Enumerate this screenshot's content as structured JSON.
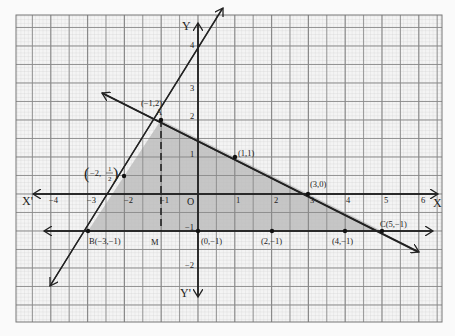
{
  "chart_data": {
    "type": "line",
    "title": "",
    "xlabel": "X",
    "ylabel": "Y",
    "x_negative_label": "X'",
    "y_negative_label": "Y'",
    "origin_label": "O",
    "xlim": [
      -4.5,
      6.5
    ],
    "ylim": [
      -3.5,
      5
    ],
    "grid": true,
    "x_ticks": [
      "-4",
      "-3",
      "-2",
      "-1",
      "1",
      "2",
      "3",
      "4",
      "5",
      "6"
    ],
    "y_ticks": [
      "4",
      "3",
      "2",
      "1",
      "-1",
      "-2"
    ],
    "series": [
      {
        "name": "line BA (3x - 2y + 7 = 0)",
        "points": [
          [
            -4.1,
            -2.5
          ],
          [
            0.6,
            4.7
          ]
        ]
      },
      {
        "name": "line x + 2y = 3",
        "points": [
          [
            -2.6,
            2.8
          ],
          [
            6,
            -1.5
          ]
        ]
      },
      {
        "name": "line y = -1",
        "points": [
          [
            -3.9,
            -1
          ],
          [
            6.3,
            -1
          ]
        ]
      },
      {
        "name": "dashed AM (x = -1)",
        "points": [
          [
            -1,
            2
          ],
          [
            -1,
            -1
          ]
        ]
      }
    ],
    "shaded_region": {
      "vertices": [
        [
          -3,
          -1
        ],
        [
          -1,
          2
        ],
        [
          5,
          -1
        ]
      ],
      "fill": "#bdbdbd"
    },
    "points": [
      {
        "label": "(-1,2)",
        "sublabel": "A",
        "x": -1,
        "y": 2
      },
      {
        "label": "B(-3,-1)",
        "x": -3,
        "y": -1
      },
      {
        "label": "C(5,-1)",
        "x": 5,
        "y": -1
      },
      {
        "label": "(1,1)",
        "x": 1,
        "y": 1
      },
      {
        "label": "(3,0)",
        "x": 3,
        "y": 0
      },
      {
        "label": "(0,-1)",
        "x": 0,
        "y": -1
      },
      {
        "label": "(2,-1)",
        "x": 2,
        "y": -1
      },
      {
        "label": "(4,-1)",
        "x": 4,
        "y": -1
      },
      {
        "label": "(-2, 1/2)",
        "x": -2,
        "y": 0.5
      },
      {
        "label": "M",
        "x": -1,
        "y": -1
      }
    ]
  },
  "labels": {
    "Y": "Y",
    "Yp": "Y'",
    "X": "X",
    "Xp": "X'",
    "O": "O",
    "A_coord": "(−1,2)",
    "A": "A",
    "B": "B(−3,−1)",
    "C": "C(5,−1)",
    "M": "M",
    "p11": "(1,1)",
    "p30": "(3,0)",
    "p0m1": "(0,−1)",
    "p2m1": "(2,−1)",
    "p4m1": "(4,−1)",
    "pm2_half_a": "−2,",
    "pm2_half_num": "1",
    "pm2_half_den": "2",
    "xt_m4": "−4",
    "xt_m3": "−3",
    "xt_m2": "−2",
    "xt_m1": "−1",
    "xt_1": "1",
    "xt_2": "2",
    "xt_3": "3",
    "xt_4": "4",
    "xt_5": "5",
    "xt_6": "6",
    "yt_4": "4",
    "yt_3": "3",
    "yt_2": "2",
    "yt_1": "1",
    "yt_m1": "−1",
    "yt_m2": "−2"
  }
}
